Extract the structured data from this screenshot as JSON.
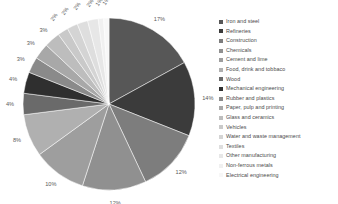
{
  "chart_data": {
    "type": "pie",
    "title": "",
    "legend_position": "right",
    "grid": false,
    "categories": [
      "Iron and steel",
      "Refineries",
      "Construction",
      "Chemicals",
      "Cement and lime",
      "Food, drink and tobbaco",
      "Wood",
      "Mechanical engineering",
      "Rubber and plastics",
      "Paper, pulp and printing",
      "Glass and ceramics",
      "Vehicles",
      "Water and waste management",
      "Textiles",
      "Other manufacturing",
      "Non-ferrous metals",
      "Electrical engineering"
    ],
    "values": [
      17,
      14,
      12,
      12,
      10,
      8,
      4,
      4,
      3,
      3,
      3,
      2,
      2,
      2,
      2,
      1,
      1
    ],
    "value_labels": [
      "17%",
      "14%",
      "12%",
      "12%",
      "10%",
      "8%",
      "4%",
      "4%",
      "3%",
      "3%",
      "3%",
      "2%",
      "2%",
      "2%",
      "2%",
      "1%",
      "1%"
    ],
    "colors": [
      "#575757",
      "#3b3b3b",
      "#7d7d7d",
      "#909090",
      "#9e9e9e",
      "#b0b0b0",
      "#6a6a6a",
      "#2f2f2f",
      "#8a8a8a",
      "#a8a8a8",
      "#bdbdbd",
      "#c9c9c9",
      "#d4d4d4",
      "#dedede",
      "#e7e7e7",
      "#f0f0f0",
      "#f7f7f7"
    ],
    "start_angle_deg": 0,
    "direction": "clockwise"
  }
}
